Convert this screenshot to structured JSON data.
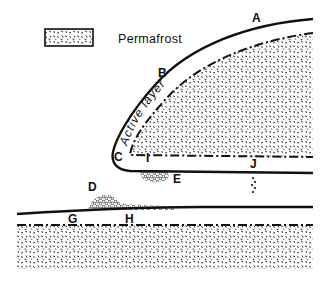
{
  "legend": {
    "label": "Permafrost",
    "symbol": "stippled-box"
  },
  "labels": {
    "A": "A",
    "B": "B",
    "C": "C",
    "D": "D",
    "E": "E",
    "G": "G",
    "H": "H",
    "I": "I",
    "J": "J"
  },
  "annotations": {
    "active_layer": "Active layer"
  },
  "colors": {
    "ink": "#111111",
    "background": "#ffffff"
  }
}
